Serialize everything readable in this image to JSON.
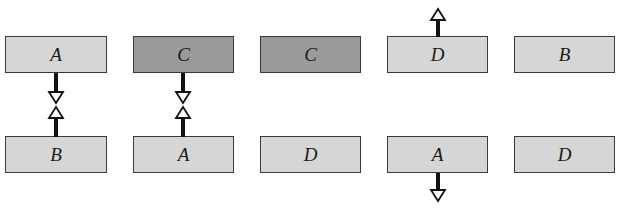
{
  "diagram": {
    "colors": {
      "light_box": "#d6d6d6",
      "dark_box": "#9a9a9a",
      "border": "#3a3a3a",
      "arrow": "#111111"
    },
    "columns": [
      {
        "top": {
          "label": "A",
          "shade": "light"
        },
        "bottom": {
          "label": "B",
          "shade": "light"
        },
        "arrows": [
          "top-down-to-middle",
          "bottom-up-to-middle"
        ]
      },
      {
        "top": {
          "label": "C",
          "shade": "dark"
        },
        "bottom": {
          "label": "A",
          "shade": "light"
        },
        "arrows": [
          "top-down-to-middle",
          "bottom-up-to-middle"
        ]
      },
      {
        "top": {
          "label": "C",
          "shade": "dark"
        },
        "bottom": {
          "label": "D",
          "shade": "light"
        },
        "arrows": []
      },
      {
        "top": {
          "label": "D",
          "shade": "light"
        },
        "bottom": {
          "label": "A",
          "shade": "light"
        },
        "arrows": [
          "top-up-outward",
          "bottom-down-outward"
        ]
      },
      {
        "top": {
          "label": "B",
          "shade": "light"
        },
        "bottom": {
          "label": "D",
          "shade": "light"
        },
        "arrows": []
      }
    ]
  }
}
